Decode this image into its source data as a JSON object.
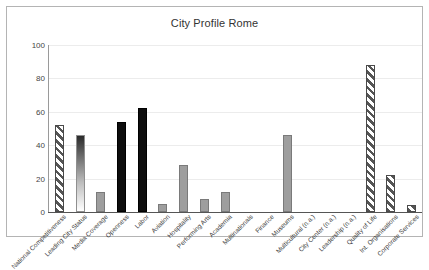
{
  "chart_data": {
    "type": "bar",
    "title": "City Profile Rome",
    "xlabel": "",
    "ylabel": "",
    "ylim": [
      0,
      100
    ],
    "yticks": [
      100,
      80,
      60,
      40,
      20,
      0
    ],
    "grid": true,
    "legend": "none",
    "categories": [
      "National Competitiveness",
      "Leading City Status",
      "Media Coverage",
      "Openness",
      "Labor",
      "Aviation",
      "Hospitality",
      "Performing Arts",
      "Academia",
      "Multinationals",
      "Finance",
      "Museums",
      "Multicultural (n.a.)",
      "City Center (n.a.)",
      "Leadership (n.a.)",
      "Quality of Life",
      "Int. Organisations",
      "Corporate Services"
    ],
    "values": [
      52,
      46,
      12,
      54,
      62,
      5,
      28,
      8,
      12,
      0,
      0,
      46,
      0,
      0,
      0,
      88,
      22,
      4
    ],
    "bar_styles": [
      "hatch",
      "gradient",
      "solid",
      "black",
      "black",
      "solid",
      "solid",
      "solid",
      "solid",
      "none",
      "none",
      "solid",
      "none",
      "none",
      "none",
      "hatch",
      "hatch",
      "hatch"
    ],
    "colors": {
      "solid": "#9e9e9e",
      "black": "#0d0d0d",
      "hatch": "#555555",
      "grid": "#ececec",
      "axis": "#555555",
      "frame": "#b4b4b4",
      "text": "#333333"
    }
  }
}
